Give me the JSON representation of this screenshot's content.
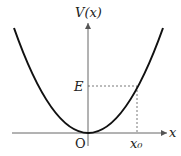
{
  "diagram": {
    "type": "potential-energy-curve",
    "curve": "parabola",
    "labels": {
      "y_axis": "V(x)",
      "x_axis": "x",
      "origin": "O",
      "energy": "E",
      "turning_point": "x₀"
    },
    "colors": {
      "curve": "#111111",
      "axes": "#555555",
      "dashed": "#555555",
      "background": "#ffffff"
    }
  }
}
